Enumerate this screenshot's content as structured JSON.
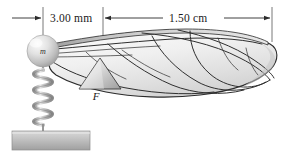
{
  "figure": {
    "type": "physics-diagram",
    "background_color": "#ffffff"
  },
  "dimensions": [
    {
      "id": "left-span",
      "label": "3.00 mm",
      "value": 3.0,
      "unit": "mm",
      "from_x": 43,
      "to_x": 103,
      "arrow_style": "outward-both",
      "line_y": 18
    },
    {
      "id": "right-span",
      "label": "1.50 cm",
      "value": 1.5,
      "unit": "cm",
      "from_x": 103,
      "to_x": 272,
      "arrow_style": "inward-both",
      "line_y": 18
    }
  ],
  "labels": {
    "mass": "m",
    "force": "F"
  },
  "colors": {
    "ink": "#2b2b2b",
    "wing_fill_light": "#f4f4f4",
    "wing_fill_mid": "#dcdcdc",
    "wing_fill_dark": "#b8b8b8",
    "ball_light": "#f2f2f2",
    "ball_dark": "#9a9a9a",
    "spring": "#a8a8a8",
    "base_top": "#d2d2d2",
    "base_bottom": "#a6a6a6",
    "triangle_light": "#efefef",
    "triangle_dark": "#9f9f9f"
  },
  "components": [
    {
      "name": "mass-ball",
      "shape": "sphere",
      "cx": 43,
      "cy": 51,
      "r": 16
    },
    {
      "name": "spring",
      "shape": "coil",
      "x": 43,
      "top_y": 66,
      "bottom_y": 130,
      "turns": 11
    },
    {
      "name": "support-base",
      "shape": "rectangle",
      "x": 12,
      "y": 131,
      "width": 78,
      "height": 19
    },
    {
      "name": "fulcrum-triangle",
      "shape": "triangle",
      "apex_x": 100,
      "apex_y": 59,
      "left_x": 79,
      "right_x": 121,
      "base_y": 90
    },
    {
      "name": "insect-wing",
      "shape": "wing",
      "tip_x": 276,
      "root_x": 52
    }
  ]
}
